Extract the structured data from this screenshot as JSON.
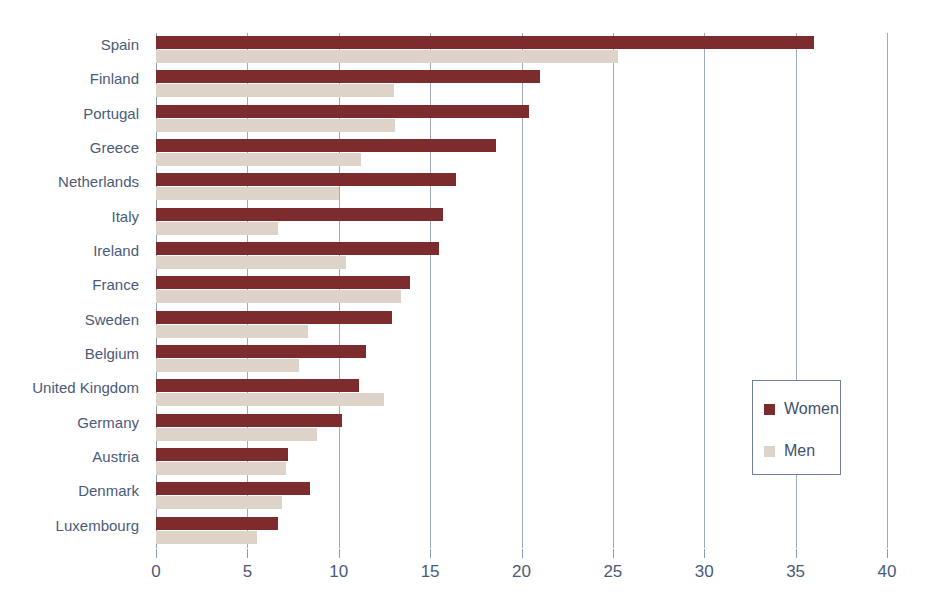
{
  "chart_data": {
    "type": "bar",
    "orientation": "horizontal",
    "title": "",
    "xlabel": "",
    "ylabel": "",
    "xlim": [
      0,
      40
    ],
    "xticks": [
      0,
      5,
      10,
      15,
      20,
      25,
      30,
      35,
      40
    ],
    "grid": true,
    "legend_position": "right-inside",
    "categories": [
      "Spain",
      "Finland",
      "Portugal",
      "Greece",
      "Netherlands",
      "Italy",
      "Ireland",
      "France",
      "Sweden",
      "Belgium",
      "United Kingdom",
      "Germany",
      "Austria",
      "Denmark",
      "Luxembourg"
    ],
    "series": [
      {
        "name": "Women",
        "color": "#7c2c2c",
        "values": [
          36.0,
          21.0,
          20.4,
          18.6,
          16.4,
          15.7,
          15.5,
          13.9,
          12.9,
          11.5,
          11.1,
          10.2,
          7.2,
          8.4,
          6.7
        ]
      },
      {
        "name": "Men",
        "color": "#ddd3c9",
        "values": [
          25.3,
          13.0,
          13.1,
          11.2,
          10.0,
          6.7,
          10.4,
          13.4,
          8.3,
          7.8,
          12.5,
          8.8,
          7.1,
          6.9,
          5.5
        ]
      }
    ]
  },
  "legend": {
    "items": [
      {
        "label": "Women",
        "color": "#7c2c2c"
      },
      {
        "label": "Men",
        "color": "#ddd3c9"
      }
    ]
  },
  "colors": {
    "women": "#7c2c2c",
    "men": "#ddd3c9",
    "axis": "#8f9bb3",
    "text": "#4a5a7a",
    "legend_border": "#6e7fa3",
    "background": "#ffffff"
  }
}
